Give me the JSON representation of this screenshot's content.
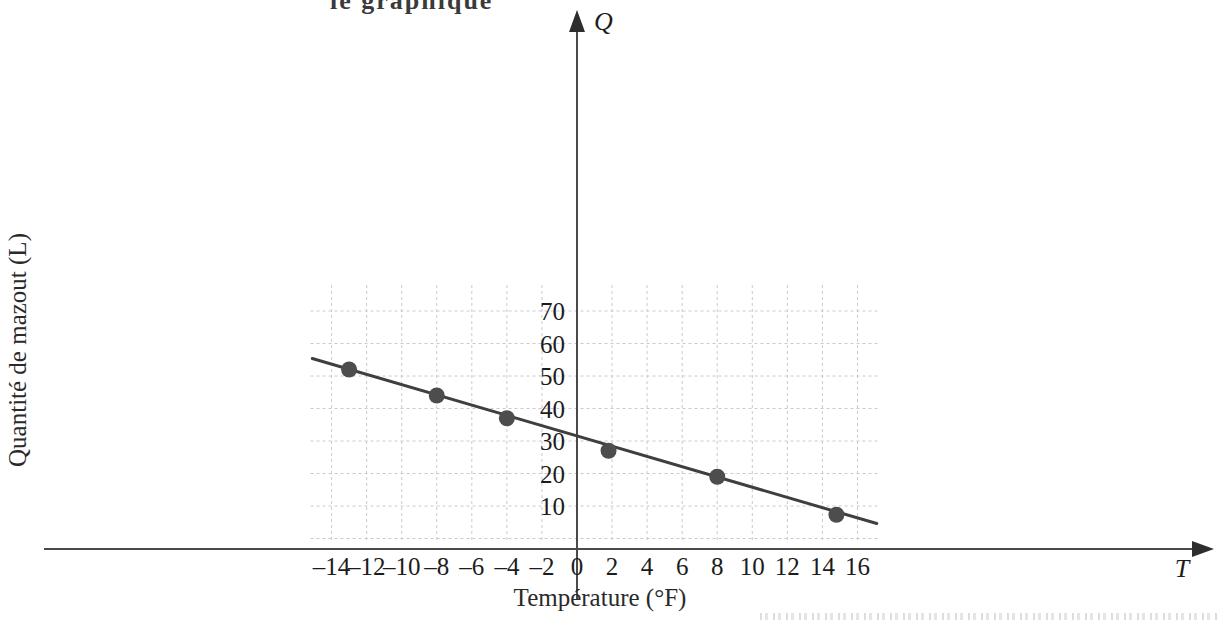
{
  "page": {
    "top_cut_text": "le graphique",
    "background_color": "#ffffff"
  },
  "chart_data": {
    "type": "scatter",
    "title": "",
    "xlabel": "Température (°F)",
    "ylabel": "Quantité de mazout (L)",
    "x_axis_symbol": "T",
    "y_axis_symbol": "Q",
    "xlim": [
      -15.2,
      17.3
    ],
    "ylim": [
      -1.0,
      78.0
    ],
    "grid": true,
    "grid_color": "#c9c9d2",
    "grid_style": "dashed",
    "grid_x_step": 2,
    "grid_y_step": 10,
    "axis_color": "#4a4a4a",
    "point_color": "#4d4d4d",
    "line_color": "#3f3f3f",
    "xticks": [
      -14,
      -12,
      -10,
      -8,
      -6,
      -4,
      -2,
      0,
      2,
      4,
      6,
      8,
      10,
      12,
      14,
      16
    ],
    "xtick_labels": [
      "–14",
      "–12",
      "–10",
      "–8",
      "–6",
      "–4",
      "–2",
      "0",
      "2",
      "4",
      "6",
      "8",
      "10",
      "12",
      "14",
      "16"
    ],
    "yticks": [
      10,
      20,
      30,
      40,
      50,
      60,
      70
    ],
    "ytick_labels": [
      "10",
      "20",
      "30",
      "40",
      "50",
      "60",
      "70"
    ],
    "points": [
      {
        "x": -13.0,
        "y": 52.0
      },
      {
        "x": -8.0,
        "y": 44.0
      },
      {
        "x": -4.0,
        "y": 37.0
      },
      {
        "x": 1.8,
        "y": 27.0
      },
      {
        "x": 8.0,
        "y": 19.0
      },
      {
        "x": 14.8,
        "y": 7.3
      }
    ],
    "trend_line": {
      "x_start": -15.1,
      "y_start": 55.4,
      "x_end": 17.1,
      "y_end": 4.6,
      "slope": -1.578,
      "intercept": 31.6
    }
  }
}
